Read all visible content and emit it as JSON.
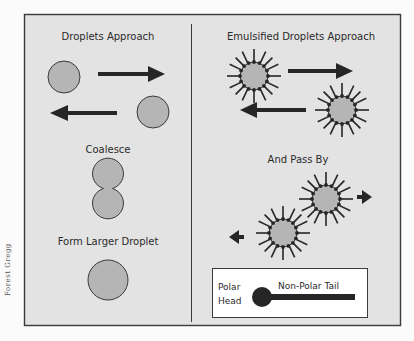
{
  "colors": {
    "page_bg": "#fbfbfb",
    "panel_bg": "#e3e3e3",
    "frame": "#3a3a3a",
    "droplet_fill": "#b5b5b5",
    "droplet_stroke": "#3a3a3a",
    "arrow": "#262626",
    "legend_bg": "#ffffff",
    "text": "#2a2a2a"
  },
  "left_panel": {
    "title": "Droplets Approach",
    "step2": "Coalesce",
    "step3": "Form Larger Droplet"
  },
  "right_panel": {
    "title": "Emulsified Droplets Approach",
    "step2": "And Pass By"
  },
  "legend": {
    "head_label_line1": "Polar",
    "head_label_line2": "Head",
    "tail_label": "Non-Polar Tail"
  },
  "credit": "Forest Gregg"
}
